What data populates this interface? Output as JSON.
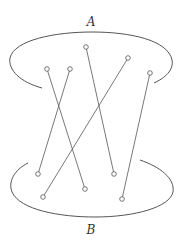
{
  "diagram": {
    "type": "bipartite-matching",
    "width": 186,
    "height": 241,
    "stroke_color": "#555555",
    "label_color": "#333333",
    "sets": [
      {
        "id": "A",
        "label": "A",
        "label_pos": [
          91,
          26
        ],
        "arc_path": "M 42 88 C 20 82, 8 70, 10 58 C 14 40, 55 32, 92 32 C 130 32, 168 40, 172 60 C 174 70, 165 78, 154 83"
      },
      {
        "id": "B",
        "label": "B",
        "label_pos": [
          91,
          234
        ],
        "arc_path": "M 28 163 C 14 170, 8 182, 12 192 C 20 210, 60 217, 95 217 C 135 217, 170 207, 173 192 C 175 178, 160 167, 140 160"
      }
    ],
    "nodes_top": [
      {
        "id": "a1",
        "x": 47,
        "y": 69
      },
      {
        "id": "a2",
        "x": 70,
        "y": 69
      },
      {
        "id": "a3",
        "x": 86,
        "y": 47
      },
      {
        "id": "a4",
        "x": 128,
        "y": 58
      },
      {
        "id": "a5",
        "x": 150,
        "y": 73
      }
    ],
    "nodes_bottom": [
      {
        "id": "b1",
        "x": 38,
        "y": 174
      },
      {
        "id": "b2",
        "x": 43,
        "y": 197
      },
      {
        "id": "b3",
        "x": 85,
        "y": 189
      },
      {
        "id": "b4",
        "x": 114,
        "y": 174
      },
      {
        "id": "b5",
        "x": 122,
        "y": 199
      }
    ],
    "edges": [
      {
        "from": "a1",
        "to": "b3"
      },
      {
        "from": "a2",
        "to": "b1"
      },
      {
        "from": "a3",
        "to": "b4"
      },
      {
        "from": "a4",
        "to": "b2"
      },
      {
        "from": "a5",
        "to": "b5"
      }
    ],
    "node_radius": 2.3
  }
}
